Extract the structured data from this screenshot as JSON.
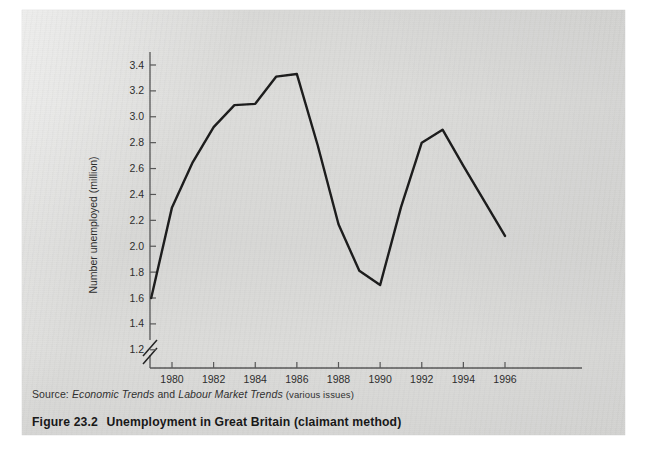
{
  "figure": {
    "caption_number": "Figure 23.2",
    "caption_text": "Unemployment in Great Britain (claimant method)",
    "source_prefix": "Source:",
    "source_italic_1": "Economic Trends",
    "source_conjunction": "and",
    "source_italic_2": "Labour Market Trends",
    "source_suffix": "(various issues)"
  },
  "colors": {
    "paper": "#d9d9d7",
    "line": "#1a1a1a",
    "axis": "#555555",
    "text": "#2b2b2b"
  },
  "chart_data": {
    "type": "line",
    "title": "Unemployment in Great Britain (claimant method)",
    "xlabel": "",
    "ylabel": "Number unemployed (million)",
    "xlim": [
      1979,
      1996
    ],
    "ylim": [
      1.2,
      3.5
    ],
    "y_axis_break": true,
    "y_break_label": "1.2",
    "grid": false,
    "legend": false,
    "ytick_labels": [
      "1.2",
      "1.4",
      "1.6",
      "1.8",
      "2.0",
      "2.2",
      "2.4",
      "2.6",
      "2.8",
      "3.0",
      "3.2",
      "3.4"
    ],
    "ytick_values": [
      1.2,
      1.4,
      1.6,
      1.8,
      2.0,
      2.2,
      2.4,
      2.6,
      2.8,
      3.0,
      3.2,
      3.4
    ],
    "xtick_labels": [
      "1980",
      "1982",
      "1984",
      "1986",
      "1988",
      "1990",
      "1992",
      "1994",
      "1996"
    ],
    "xtick_values": [
      1980,
      1982,
      1984,
      1986,
      1988,
      1990,
      1992,
      1994,
      1996
    ],
    "x": [
      1979,
      1980,
      1981,
      1982,
      1983,
      1984,
      1985,
      1986,
      1987,
      1988,
      1989,
      1990,
      1991,
      1992,
      1993,
      1994,
      1995,
      1996
    ],
    "values": [
      1.6,
      2.3,
      2.65,
      2.92,
      3.09,
      3.1,
      3.31,
      3.33,
      2.78,
      2.17,
      1.81,
      1.7,
      2.3,
      2.8,
      2.9,
      2.62,
      2.35,
      2.08
    ],
    "series": [
      {
        "name": "Number unemployed (million)",
        "values": [
          1.6,
          2.3,
          2.65,
          2.92,
          3.09,
          3.1,
          3.31,
          3.33,
          2.78,
          2.17,
          1.81,
          1.7,
          2.3,
          2.8,
          2.9,
          2.62,
          2.35,
          2.08
        ]
      }
    ]
  }
}
